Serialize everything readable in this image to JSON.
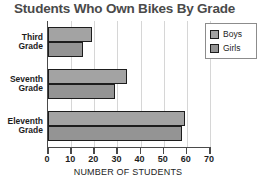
{
  "chart_data": {
    "type": "bar",
    "orientation": "horizontal",
    "title": "Students Who Own Bikes By Grade",
    "xlabel": "NUMBER OF STUDENTS",
    "ylabel": "",
    "categories": [
      "Third Grade",
      "Seventh Grade",
      "Eleventh Grade"
    ],
    "category_lines": [
      [
        "Third",
        "Grade"
      ],
      [
        "Seventh",
        "Grade"
      ],
      [
        "Eleventh",
        "Grade"
      ]
    ],
    "series": [
      {
        "name": "Boys",
        "values": [
          19,
          34,
          59
        ],
        "color": "#a3a3a3"
      },
      {
        "name": "Girls",
        "values": [
          15,
          29,
          58
        ],
        "color": "#949494"
      }
    ],
    "xlim": [
      0,
      70
    ],
    "xticks": [
      0,
      10,
      20,
      30,
      40,
      50,
      60,
      70
    ],
    "xtick_labels": [
      "0",
      "10",
      "20",
      "30",
      "40",
      "50",
      "60",
      "70"
    ],
    "grid": true,
    "grid_axis": "x",
    "legend": {
      "position": "top-right",
      "entries": [
        "Boys",
        "Girls"
      ]
    }
  },
  "colors": {
    "title": "#4a4a4a",
    "axis": "#4a4a4a",
    "grid": "#d6d6d6",
    "bar_outline": "#1d1d1d",
    "boys": "#a3a3a3",
    "girls": "#949494",
    "legend_border": "#8c8c8c",
    "background": "#ffffff"
  }
}
